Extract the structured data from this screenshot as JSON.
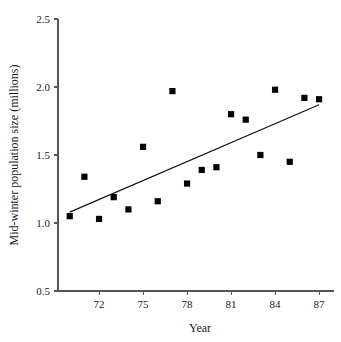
{
  "chart_data": {
    "type": "scatter",
    "title": "",
    "xlabel": "Year",
    "ylabel": "Mid-winter population size (millions)",
    "xlim": [
      69.2,
      88.0
    ],
    "ylim": [
      0.5,
      2.5
    ],
    "xticks": [
      72,
      75,
      78,
      81,
      84,
      87
    ],
    "xtick_labels": [
      "72",
      "75",
      "78",
      "81",
      "84",
      "87"
    ],
    "yticks": [
      0.5,
      1.0,
      1.5,
      2.0,
      2.5
    ],
    "ytick_labels": [
      "0.5",
      "1.0",
      "1.5",
      "2.0",
      "2.5"
    ],
    "grid": false,
    "legend": false,
    "marker": "square",
    "marker_color": "#000000",
    "x": [
      70,
      71,
      72,
      73,
      74,
      75,
      76,
      77,
      78,
      79,
      80,
      81,
      82,
      83,
      84,
      85,
      86,
      87
    ],
    "y": [
      1.05,
      1.34,
      1.03,
      1.19,
      1.1,
      1.56,
      1.16,
      1.97,
      1.29,
      1.39,
      1.41,
      1.8,
      1.76,
      1.5,
      1.98,
      1.45,
      1.92,
      1.91
    ],
    "points": [
      {
        "year": 70,
        "population": 1.05
      },
      {
        "year": 71,
        "population": 1.34
      },
      {
        "year": 72,
        "population": 1.03
      },
      {
        "year": 73,
        "population": 1.19
      },
      {
        "year": 74,
        "population": 1.1
      },
      {
        "year": 75,
        "population": 1.56
      },
      {
        "year": 76,
        "population": 1.16
      },
      {
        "year": 77,
        "population": 1.97
      },
      {
        "year": 78,
        "population": 1.29
      },
      {
        "year": 79,
        "population": 1.39
      },
      {
        "year": 80,
        "population": 1.41
      },
      {
        "year": 81,
        "population": 1.8
      },
      {
        "year": 82,
        "population": 1.76
      },
      {
        "year": 83,
        "population": 1.5
      },
      {
        "year": 84,
        "population": 1.98
      },
      {
        "year": 85,
        "population": 1.45
      },
      {
        "year": 86,
        "population": 1.92
      },
      {
        "year": 87,
        "population": 1.91
      }
    ],
    "trend_line": {
      "name": "regression-line",
      "x_start": 70.0,
      "y_start": 1.08,
      "x_end": 87.0,
      "y_end": 1.87,
      "color": "#111111"
    }
  }
}
